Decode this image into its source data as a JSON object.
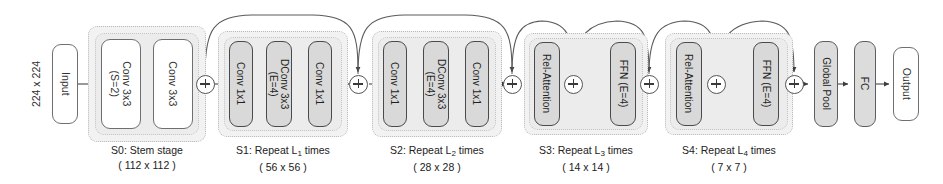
{
  "diagram": {
    "input_resolution": "224 x 224",
    "input_label": "Input",
    "output_label": "Output",
    "tail": [
      {
        "name": "global-pool",
        "label": "Global Pool"
      },
      {
        "name": "fc",
        "label": "FC"
      }
    ],
    "sum_symbol": "+",
    "stages": [
      {
        "id": "S0",
        "caption_main": "S0: Stem stage",
        "caption_dim": "( 112 x 112 )",
        "repeat_prefix": "",
        "repeat_sub": "",
        "repeat_suffix": "",
        "blocks": [
          {
            "name": "conv3x3-s2",
            "line1": "Conv 3x3",
            "line2": "(S=2)",
            "style": "white"
          },
          {
            "name": "conv3x3",
            "line1": "Conv 3x3",
            "line2": "",
            "style": "white"
          }
        ]
      },
      {
        "id": "S1",
        "caption_main": "S1: Repeat L",
        "caption_sub": "1",
        "caption_tail": " times",
        "caption_dim": "( 56 x 56 )",
        "blocks": [
          {
            "name": "conv1x1",
            "line1": "Conv 1x1",
            "line2": "",
            "style": "gray"
          },
          {
            "name": "dconv3x3-e4",
            "line1": "DConv 3x3",
            "line2": "(E=4)",
            "style": "gray"
          },
          {
            "name": "conv1x1-out",
            "line1": "Conv 1x1",
            "line2": "",
            "style": "gray"
          }
        ]
      },
      {
        "id": "S2",
        "caption_main": "S2: Repeat L",
        "caption_sub": "2",
        "caption_tail": " times",
        "caption_dim": "( 28 x 28 )",
        "blocks": [
          {
            "name": "conv1x1",
            "line1": "Conv 1x1",
            "line2": "",
            "style": "gray"
          },
          {
            "name": "dconv3x3-e4",
            "line1": "DConv 3x3",
            "line2": "(E=4)",
            "style": "gray"
          },
          {
            "name": "conv1x1-out",
            "line1": "Conv 1x1",
            "line2": "",
            "style": "gray"
          }
        ]
      },
      {
        "id": "S3",
        "caption_main": "S3: Repeat L",
        "caption_sub": "3",
        "caption_tail": " times",
        "caption_dim": "( 14 x 14 )",
        "blocks": [
          {
            "name": "rel-attention",
            "line1": "Rel-Attention",
            "line2": "",
            "style": "gray"
          },
          {
            "name": "ffn-e4",
            "line1": "FFN (E=4)",
            "line2": "",
            "style": "gray"
          }
        ]
      },
      {
        "id": "S4",
        "caption_main": "S4: Repeat L",
        "caption_sub": "4",
        "caption_tail": " times",
        "caption_dim": "( 7 x 7 )",
        "blocks": [
          {
            "name": "rel-attention",
            "line1": "Rel-Attention",
            "line2": "",
            "style": "gray"
          },
          {
            "name": "ffn-e4",
            "line1": "FFN (E=4)",
            "line2": "",
            "style": "gray"
          }
        ]
      }
    ]
  }
}
